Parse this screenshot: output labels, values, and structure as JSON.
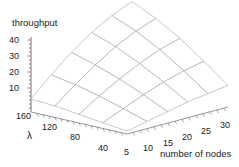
{
  "chart_data": {
    "type": "surface",
    "title": "throughput",
    "xlabel": "number of nodes",
    "ylabel": "λ",
    "zlabel": "throughput",
    "x": [
      5,
      10,
      15,
      20,
      25,
      30
    ],
    "y": [
      40,
      80,
      120,
      160,
      200
    ],
    "z_ticks": [
      10,
      20,
      30,
      40
    ],
    "zlim": [
      0,
      50
    ],
    "xlim": [
      5,
      30
    ],
    "ylim": [
      40,
      200
    ],
    "grid": true,
    "legend": "none",
    "surface_color": "#ffffff",
    "mesh_color": "#9a9a9a",
    "axis_color": "#555555",
    "text_color": "#1a1a1a",
    "note": "z[row=lambda][col=nodes]; rows low-to-high lambda, cols low-to-high nodes",
    "z": [
      [
        2,
        5,
        8,
        11,
        13,
        15
      ],
      [
        4,
        10,
        16,
        21,
        25,
        28
      ],
      [
        6,
        15,
        23,
        30,
        36,
        40
      ],
      [
        8,
        19,
        29,
        38,
        45,
        50
      ],
      [
        9,
        22,
        34,
        44,
        52,
        58
      ]
    ]
  },
  "axes": {
    "x_tick_labels": [
      "5",
      "10",
      "15",
      "20",
      "25",
      "30"
    ],
    "y_tick_labels": [
      "40",
      "80",
      "120",
      "160"
    ],
    "z_tick_labels": [
      "40",
      "30",
      "20",
      "10"
    ],
    "x_axis_label": "number of nodes",
    "y_axis_label": "λ",
    "z_axis_label": "throughput"
  }
}
